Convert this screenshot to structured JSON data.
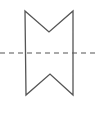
{
  "diagram": {
    "title": "",
    "shape": {
      "type": "notched-rectangle",
      "points": [
        [
          25,
          11
        ],
        [
          49,
          32
        ],
        [
          73,
          11
        ],
        [
          73,
          95
        ],
        [
          50,
          74
        ],
        [
          26,
          95
        ]
      ],
      "stroke": "#555555",
      "stroke_width": 1.3,
      "fill": "none"
    },
    "symmetry_axis": {
      "type": "dashed-line",
      "x1": 0,
      "y1": 53,
      "x2": 98,
      "y2": 53,
      "stroke": "#555555",
      "dash": "5,4"
    }
  }
}
